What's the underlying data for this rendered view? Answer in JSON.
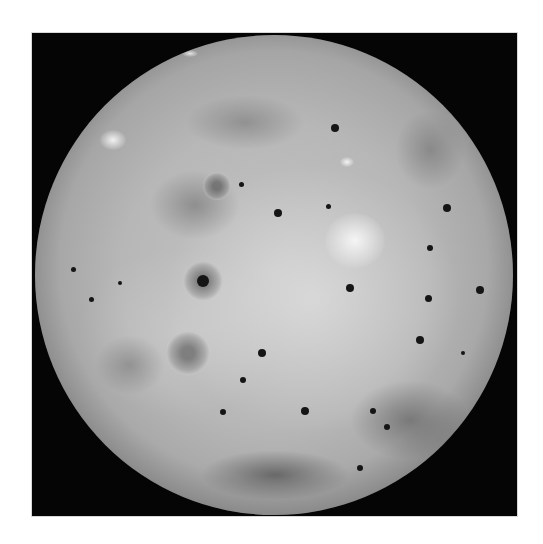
{
  "image": {
    "subject": "planetary-moon-globe",
    "description": "Grayscale full-disk view of a volcanic moon on black background inside a white border",
    "colors": {
      "page_background": "#ffffff",
      "frame_background": "#050505",
      "surface_light": "#d6d6d6",
      "surface_mid": "#b0b0b0",
      "surface_dark": "#6e6e6e",
      "spot": "#151515"
    },
    "frame": {
      "x": 32,
      "y": 33,
      "width": 485,
      "height": 483
    },
    "disk": {
      "center_x": 274,
      "center_y": 275,
      "radius": 239
    },
    "dark_regions": [
      {
        "x": 150,
        "y": 170,
        "w": 90,
        "h": 70,
        "opacity": 0.35
      },
      {
        "x": 185,
        "y": 95,
        "w": 120,
        "h": 55,
        "opacity": 0.3
      },
      {
        "x": 350,
        "y": 380,
        "w": 120,
        "h": 80,
        "opacity": 0.45
      },
      {
        "x": 200,
        "y": 450,
        "w": 150,
        "h": 50,
        "opacity": 0.6
      },
      {
        "x": 95,
        "y": 335,
        "w": 70,
        "h": 60,
        "opacity": 0.3
      },
      {
        "x": 395,
        "y": 110,
        "w": 70,
        "h": 80,
        "opacity": 0.3
      }
    ],
    "bright_regions": [
      {
        "x": 347,
        "y": 162,
        "w": 14,
        "h": 10
      },
      {
        "x": 113,
        "y": 140,
        "w": 26,
        "h": 20
      },
      {
        "x": 190,
        "y": 53,
        "w": 16,
        "h": 7
      },
      {
        "x": 355,
        "y": 240,
        "w": 60,
        "h": 55
      }
    ],
    "spots": [
      {
        "x": 335,
        "y": 128,
        "r": 4
      },
      {
        "x": 241,
        "y": 184,
        "r": 2.5
      },
      {
        "x": 278,
        "y": 213,
        "r": 4
      },
      {
        "x": 328,
        "y": 206,
        "r": 2.5
      },
      {
        "x": 447,
        "y": 208,
        "r": 4
      },
      {
        "x": 430,
        "y": 248,
        "r": 3
      },
      {
        "x": 428,
        "y": 298,
        "r": 3.5
      },
      {
        "x": 480,
        "y": 290,
        "r": 4
      },
      {
        "x": 350,
        "y": 288,
        "r": 4
      },
      {
        "x": 203,
        "y": 281,
        "r": 6
      },
      {
        "x": 120,
        "y": 283,
        "r": 2
      },
      {
        "x": 262,
        "y": 353,
        "r": 4
      },
      {
        "x": 305,
        "y": 411,
        "r": 4
      },
      {
        "x": 387,
        "y": 427,
        "r": 3
      },
      {
        "x": 373,
        "y": 411,
        "r": 3
      },
      {
        "x": 360,
        "y": 468,
        "r": 3
      },
      {
        "x": 420,
        "y": 340,
        "r": 4
      },
      {
        "x": 223,
        "y": 412,
        "r": 3
      },
      {
        "x": 91,
        "y": 299,
        "r": 2.5
      },
      {
        "x": 73,
        "y": 269,
        "r": 2.5
      },
      {
        "x": 243,
        "y": 380,
        "r": 3
      },
      {
        "x": 463,
        "y": 353,
        "r": 2
      }
    ],
    "halo_spots": [
      {
        "x": 203,
        "y": 281,
        "r": 20
      },
      {
        "x": 217,
        "y": 186,
        "r": 14
      },
      {
        "x": 188,
        "y": 353,
        "r": 22
      }
    ]
  }
}
